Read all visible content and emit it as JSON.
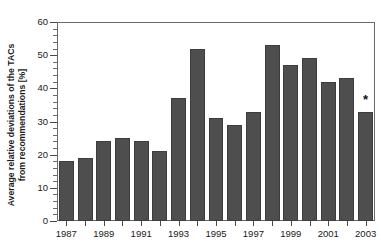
{
  "chart_data": {
    "type": "bar",
    "title": "",
    "xlabel": "",
    "ylabel": "Average relative deviations of the TACs from recommendations [%]",
    "ylabel_line1": "Average relative deviations of the TACs",
    "ylabel_line2": "from recommendations [%]",
    "categories": [
      "1987",
      "1988",
      "1989",
      "1990",
      "1991",
      "1992",
      "1993",
      "1994",
      "1995",
      "1996",
      "1997",
      "1998",
      "1999",
      "2000",
      "2001",
      "2002",
      "2003"
    ],
    "values": [
      18,
      19,
      24,
      25,
      24,
      21,
      37,
      52,
      31,
      29,
      33,
      53,
      47,
      49,
      42,
      43,
      33
    ],
    "xtick_labels": [
      "1987",
      "1989",
      "1991",
      "1993",
      "1995",
      "1997",
      "1999",
      "2001",
      "2003"
    ],
    "xtick_categories": [
      "1987",
      "1989",
      "1991",
      "1993",
      "1995",
      "1997",
      "1999",
      "2001",
      "2003"
    ],
    "ylim": [
      0,
      60
    ],
    "ytick_values": [
      0,
      10,
      20,
      30,
      40,
      50,
      60
    ],
    "ytick_labels": [
      "0",
      "10",
      "20",
      "30",
      "40",
      "50",
      "60"
    ],
    "yminor_step": 2,
    "grid": false,
    "legend": null,
    "annotations": [
      {
        "category": "2003",
        "text": "*",
        "value": 33
      }
    ],
    "bar_color": "#4e4e4e",
    "bar_edge_color": "#3d3d3d",
    "frame_color": "#6a6a6a",
    "text_color": "#1a1a1a"
  }
}
